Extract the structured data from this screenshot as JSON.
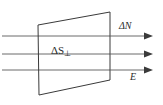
{
  "figure": {
    "type": "physics-flux-diagram",
    "width": 163,
    "height": 105,
    "background_color": "#ffffff",
    "stroke_color": "#3a3a3a",
    "line_color": "#5a5a5a",
    "text_color": "#2b2b2b"
  },
  "surface": {
    "name": "perpendicular-area-element",
    "shape": "parallelogram",
    "points": "38,25 110,12 110,80 39,95",
    "label": "ΔS",
    "label_subscript": "⊥",
    "fill": "none"
  },
  "incoming_rays": {
    "name": "incoming-flux-lines",
    "count": 3,
    "y_positions": [
      36,
      54,
      70
    ],
    "x_start": 2,
    "x_end": 110
  },
  "outgoing_rays": {
    "name": "outgoing-flux-arrows",
    "count": 3,
    "y_positions": [
      36,
      54,
      70
    ],
    "x_start": 110,
    "x_end": 152
  },
  "labels": {
    "flux_count": "ΔN",
    "field": "E"
  }
}
